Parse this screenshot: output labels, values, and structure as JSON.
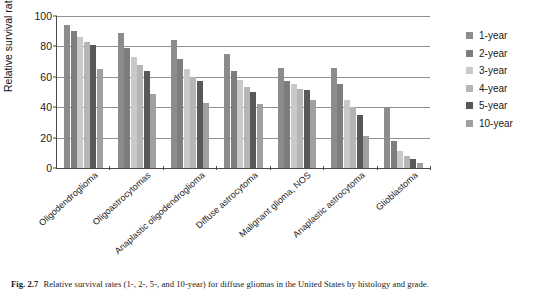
{
  "figure": {
    "caption_number": "Fig. 2.7",
    "caption_text": "Relative survival rates (1-, 2-, 5-, and 10-year) for diffuse gliomas in the United States by histology and grade."
  },
  "axes": {
    "y_title": "Relative survival rate (%)",
    "y_ticks": [
      "0",
      "20",
      "40",
      "60",
      "80",
      "100"
    ],
    "y_min": 0,
    "y_max": 100
  },
  "legend": {
    "position": "right",
    "items": [
      {
        "label": "1-year",
        "color": "#8c8c8c"
      },
      {
        "label": "2-year",
        "color": "#7d7d7d"
      },
      {
        "label": "3-year",
        "color": "#c9c9c9"
      },
      {
        "label": "4-year",
        "color": "#b5b5b5"
      },
      {
        "label": "5-year",
        "color": "#585858"
      },
      {
        "label": "10-year",
        "color": "#a0a0a0"
      }
    ]
  },
  "chart_data": {
    "type": "bar",
    "title": "",
    "xlabel": "",
    "ylabel": "Relative survival rate (%)",
    "ylim": [
      0,
      100
    ],
    "grid": true,
    "legend_position": "right",
    "categories": [
      "Oligodendroglioma",
      "Oligoastrocytomas",
      "Anaplastic oligodendroglioma",
      "Diffuse astrocytoma",
      "Malignant glioma, NOS",
      "Anaplastic astrocytoma",
      "Glioblastoma"
    ],
    "series": [
      {
        "name": "1-year",
        "color": "#8c8c8c",
        "values": [
          94,
          89,
          84,
          75,
          66,
          66,
          40
        ]
      },
      {
        "name": "2-year",
        "color": "#7d7d7d",
        "values": [
          90,
          79,
          72,
          64,
          57,
          55,
          18
        ]
      },
      {
        "name": "3-year",
        "color": "#c9c9c9",
        "values": [
          86,
          73,
          65,
          58,
          55,
          45,
          11
        ]
      },
      {
        "name": "4-year",
        "color": "#b5b5b5",
        "values": [
          83,
          68,
          60,
          53,
          52,
          40,
          8
        ]
      },
      {
        "name": "5-year",
        "color": "#585858",
        "values": [
          81,
          64,
          57,
          50,
          51,
          35,
          6
        ]
      },
      {
        "name": "10-year",
        "color": "#a0a0a0",
        "values": [
          65,
          49,
          43,
          42,
          45,
          21,
          3
        ]
      }
    ]
  }
}
